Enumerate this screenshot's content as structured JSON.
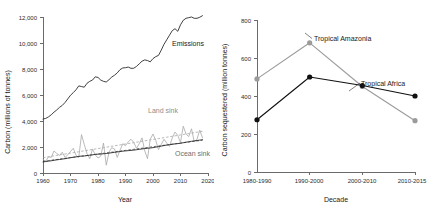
{
  "figure": {
    "title": "",
    "panels": [
      "emissions-and-sinks",
      "carbon-sequestered-by-region"
    ]
  },
  "chart_data": [
    {
      "type": "line",
      "id": "global-carbon-budget",
      "title": "",
      "xlabel": "Year",
      "ylabel": "Carbon (millions of tonnes)",
      "xlim": [
        1960,
        2020
      ],
      "ylim": [
        0,
        12000
      ],
      "xticks": [
        1960,
        1970,
        1980,
        1990,
        2000,
        2010,
        2020
      ],
      "xtick_labels": [
        "1960",
        "1970",
        "1980",
        "1990",
        "2000",
        "2010",
        "2020"
      ],
      "yticks": [
        0,
        2000,
        4000,
        6000,
        8000,
        10000,
        12000
      ],
      "ytick_labels": [
        "0",
        "2,000",
        "4,000",
        "6,000",
        "8,000",
        "10,000",
        "12,000"
      ],
      "grid": false,
      "legend_position": "inline-annotations",
      "annotations": [
        {
          "text": "Emissions",
          "x": 2006,
          "y": 9700,
          "color": "#1a1a1a"
        },
        {
          "text": "Land sink",
          "x": 2002,
          "y": 4450,
          "color": "#8e8e8e"
        },
        {
          "text": "Ocean sink",
          "x": 2012,
          "y": 1650,
          "color": "#6e6e6e"
        }
      ],
      "x": [
        1960,
        1961,
        1962,
        1963,
        1964,
        1965,
        1966,
        1967,
        1968,
        1969,
        1970,
        1971,
        1972,
        1973,
        1974,
        1975,
        1976,
        1977,
        1978,
        1979,
        1980,
        1981,
        1982,
        1983,
        1984,
        1985,
        1986,
        1987,
        1988,
        1989,
        1990,
        1991,
        1992,
        1993,
        1994,
        1995,
        1996,
        1997,
        1998,
        1999,
        2000,
        2001,
        2002,
        2003,
        2004,
        2005,
        2006,
        2007,
        2008,
        2009,
        2010,
        2011,
        2012,
        2013,
        2014,
        2015,
        2016,
        2017,
        2018
      ],
      "series": [
        {
          "name": "Emissions",
          "color": "#2b2b2b",
          "style": "solid",
          "values": [
            4150,
            4200,
            4320,
            4480,
            4680,
            4850,
            5050,
            5200,
            5420,
            5700,
            5980,
            6180,
            6400,
            6700,
            6650,
            6600,
            6900,
            7050,
            7150,
            7400,
            7350,
            7150,
            7050,
            7000,
            7180,
            7380,
            7520,
            7700,
            7950,
            8080,
            8100,
            8150,
            8050,
            8060,
            8200,
            8400,
            8600,
            8700,
            8650,
            8550,
            8800,
            8950,
            9050,
            9450,
            9900,
            10250,
            10600,
            10950,
            11100,
            10900,
            11400,
            11750,
            11900,
            11950,
            12000,
            11900,
            11900,
            11980,
            12100
          ]
        },
        {
          "name": "Land sink",
          "color": "#a8a8a8",
          "style": "solid",
          "values": [
            1050,
            900,
            1250,
            1200,
            1700,
            1500,
            1350,
            1600,
            1200,
            1400,
            1650,
            1900,
            1350,
            1200,
            2950,
            2200,
            1500,
            1100,
            1850,
            1400,
            1150,
            1300,
            2300,
            600,
            1600,
            1950,
            1850,
            1200,
            1750,
            2250,
            2100,
            2400,
            2600,
            2350,
            1900,
            2250,
            2700,
            1700,
            1100,
            2600,
            3000,
            2500,
            1800,
            2200,
            2600,
            2300,
            2050,
            2700,
            3150,
            2900,
            2350,
            3600,
            3000,
            2800,
            3400,
            2400,
            2600,
            3300,
            2700
          ]
        },
        {
          "name": "Land sink trend",
          "color": "#9a9a9a",
          "style": "dashed",
          "values": [
            1180,
            1215,
            1250,
            1285,
            1320,
            1355,
            1390,
            1425,
            1460,
            1495,
            1530,
            1565,
            1600,
            1635,
            1670,
            1705,
            1740,
            1775,
            1810,
            1845,
            1880,
            1915,
            1950,
            1985,
            2020,
            2055,
            2090,
            2125,
            2160,
            2195,
            2230,
            2265,
            2300,
            2335,
            2370,
            2405,
            2440,
            2475,
            2510,
            2545,
            2580,
            2615,
            2650,
            2685,
            2720,
            2755,
            2790,
            2825,
            2860,
            2895,
            2930,
            2965,
            3000,
            3035,
            3070,
            3105,
            3140,
            3175,
            3210
          ]
        },
        {
          "name": "Ocean sink",
          "color": "#2b2b2b",
          "style": "solid",
          "values": [
            850,
            880,
            910,
            940,
            980,
            1010,
            1040,
            1070,
            1100,
            1140,
            1180,
            1210,
            1240,
            1280,
            1300,
            1310,
            1340,
            1370,
            1400,
            1430,
            1450,
            1460,
            1480,
            1500,
            1530,
            1560,
            1590,
            1620,
            1650,
            1680,
            1700,
            1720,
            1740,
            1760,
            1790,
            1820,
            1850,
            1880,
            1900,
            1920,
            1950,
            1990,
            2030,
            2070,
            2110,
            2150,
            2180,
            2210,
            2240,
            2260,
            2290,
            2330,
            2370,
            2400,
            2440,
            2470,
            2500,
            2530,
            2560
          ]
        },
        {
          "name": "Ocean sink trend",
          "color": "#2b2b2b",
          "style": "dashed",
          "values": [
            900,
            928,
            956,
            984,
            1012,
            1040,
            1068,
            1096,
            1124,
            1152,
            1180,
            1208,
            1236,
            1264,
            1292,
            1320,
            1348,
            1376,
            1404,
            1432,
            1460,
            1488,
            1516,
            1544,
            1572,
            1600,
            1628,
            1656,
            1684,
            1712,
            1740,
            1768,
            1796,
            1824,
            1852,
            1880,
            1908,
            1936,
            1964,
            1992,
            2020,
            2048,
            2076,
            2104,
            2132,
            2160,
            2188,
            2216,
            2244,
            2272,
            2300,
            2328,
            2356,
            2384,
            2412,
            2440,
            2468,
            2496,
            2524
          ]
        }
      ]
    },
    {
      "type": "line",
      "id": "carbon-sequestered-by-region",
      "title": "",
      "xlabel": "Decade",
      "ylabel": "Carbon sequestered (million tonnes)",
      "ylim": [
        0,
        800
      ],
      "yticks": [
        0,
        200,
        400,
        600,
        800
      ],
      "ytick_labels": [
        "0",
        "200",
        "400",
        "600",
        "800"
      ],
      "categories": [
        "1980-1990",
        "1990-2000",
        "2000-2010",
        "2010-2015"
      ],
      "grid": false,
      "legend_position": "inline-annotations",
      "annotations": [
        {
          "text": "Tropical Amazonia",
          "color": "#1a1a1a"
        },
        {
          "text": "Tropical Africa",
          "color": "#1a1a1a"
        }
      ],
      "series": [
        {
          "name": "Tropical Amazonia",
          "color": "#9b9b9b",
          "marker": "circle",
          "values": [
            490,
            680,
            450,
            270
          ]
        },
        {
          "name": "Tropical Africa",
          "color": "#111111",
          "marker": "circle",
          "values": [
            275,
            500,
            455,
            400
          ]
        }
      ]
    }
  ]
}
